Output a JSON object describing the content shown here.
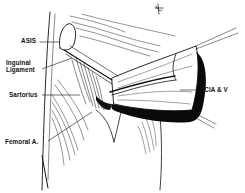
{
  "figure": {
    "type": "anatomical-illustration",
    "colors": {
      "ink": "#111111",
      "background": "#ffffff",
      "shadow": "#0a0a0a"
    },
    "labels": [
      {
        "id": "asis",
        "text": "ASIS"
      },
      {
        "id": "inguinal-ligament-line1",
        "text": "Inguinal"
      },
      {
        "id": "inguinal-ligament-line2",
        "text": "Ligament"
      },
      {
        "id": "sartorius",
        "text": "Sartorius"
      },
      {
        "id": "femoral-artery",
        "text": "Femoral A."
      },
      {
        "id": "scia-v",
        "text": "SCIA & V"
      }
    ]
  }
}
